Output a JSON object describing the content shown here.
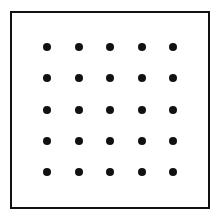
{
  "figure": {
    "canvas": {
      "width": 220,
      "height": 222,
      "background_color": "#ffffff"
    },
    "frame": {
      "name": "square-outline",
      "left": 10,
      "top": 11,
      "width": 200,
      "height": 198,
      "border_width": 2,
      "border_color": "#111111",
      "fill_color": "#ffffff"
    },
    "grid": {
      "rows": 5,
      "columns": 5,
      "total_dots": 25,
      "dot_diameter": 8,
      "dot_color": "#111111",
      "column_centers_x": [
        47,
        79,
        110,
        142,
        173
      ],
      "row_centers_y": [
        47,
        78,
        110,
        141,
        172
      ],
      "column_spacing": 31.5,
      "row_spacing": 31.25
    }
  },
  "chart_data": {
    "type": "scatter",
    "xlabel": "",
    "ylabel": "",
    "grid": false,
    "legend": null,
    "xlim": [
      10,
      210
    ],
    "ylim": [
      11,
      209
    ],
    "series": [
      {
        "name": "dots",
        "marker": "filled-circle",
        "color": "#111111",
        "size": 8,
        "points": [
          [
            47,
            47
          ],
          [
            79,
            47
          ],
          [
            110,
            47
          ],
          [
            142,
            47
          ],
          [
            173,
            47
          ],
          [
            47,
            78
          ],
          [
            79,
            78
          ],
          [
            110,
            78
          ],
          [
            142,
            78
          ],
          [
            173,
            78
          ],
          [
            47,
            110
          ],
          [
            79,
            110
          ],
          [
            110,
            110
          ],
          [
            142,
            110
          ],
          [
            173,
            110
          ],
          [
            47,
            141
          ],
          [
            79,
            141
          ],
          [
            110,
            141
          ],
          [
            142,
            141
          ],
          [
            173,
            141
          ],
          [
            47,
            172
          ],
          [
            79,
            172
          ],
          [
            110,
            172
          ],
          [
            142,
            172
          ],
          [
            173,
            172
          ]
        ]
      }
    ]
  }
}
